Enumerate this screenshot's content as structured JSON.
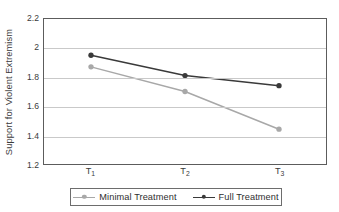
{
  "chart_data": {
    "type": "line",
    "title": "",
    "xlabel": "",
    "ylabel": "Support for Violent Extremism",
    "categories": [
      "T1",
      "T2",
      "T3"
    ],
    "category_labels": [
      {
        "base": "T",
        "sub": "1"
      },
      {
        "base": "T",
        "sub": "2"
      },
      {
        "base": "T",
        "sub": "3"
      }
    ],
    "ylim": [
      1.2,
      2.2
    ],
    "yticks": [
      2.2,
      2,
      1.8,
      1.6,
      1.4,
      1.2
    ],
    "ytick_labels": [
      "2.2",
      "2",
      "1.8",
      "1.6",
      "1.4",
      "1.2"
    ],
    "grid": true,
    "legend_position": "bottom",
    "series": [
      {
        "name": "Minimal Treatment",
        "color": "#a8a8a8",
        "marker": "circle",
        "values": [
          1.87,
          1.7,
          1.44
        ]
      },
      {
        "name": "Full Treatment",
        "color": "#3a3a3a",
        "marker": "circle",
        "values": [
          1.95,
          1.81,
          1.74
        ]
      }
    ]
  },
  "legend": {
    "entries": [
      {
        "label": "Minimal Treatment",
        "color": "#a8a8a8"
      },
      {
        "label": "Full Treatment",
        "color": "#3a3a3a"
      }
    ]
  },
  "colors": {
    "minimal_treatment": "#a8a8a8",
    "full_treatment": "#3a3a3a",
    "gridline": "#c9c9c9",
    "axis_border": "#5c5c5c",
    "text": "#3b3b3b",
    "background": "#ffffff"
  }
}
